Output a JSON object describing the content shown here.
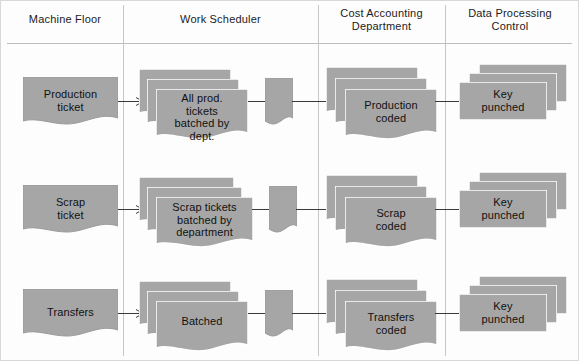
{
  "diagram": {
    "fill_color": "#a6a6a6",
    "edge_color": "#8f8f8f",
    "line_color": "#3a3a3a",
    "divider_color": "#c6c6c6",
    "lanes": [
      {
        "id": "machine-floor",
        "label": "Machine Floor"
      },
      {
        "id": "work-scheduler",
        "label": "Work Scheduler"
      },
      {
        "id": "cost-accounting",
        "label": "Cost Accounting\nDepartment",
        "line1": "Cost Accounting",
        "line2": "Department"
      },
      {
        "id": "data-processing",
        "label": "Data Processing\nControl",
        "line1": "Data Processing",
        "line2": "Control"
      }
    ],
    "rows": [
      {
        "id": "production",
        "source": {
          "label": "Production\nticket",
          "line1": "Production",
          "line2": "ticket",
          "type": "document"
        },
        "batched": {
          "label": "All prod.\ntickets\nbatched by\ndept.",
          "line1": "All prod.",
          "line2": "tickets",
          "line3": "batched by",
          "line4": "dept.",
          "type": "document-stack",
          "copies": 3
        },
        "connector": {
          "label": "",
          "type": "document"
        },
        "coded": {
          "label": "Production\ncoded",
          "line1": "Production",
          "line2": "coded",
          "type": "document-stack",
          "copies": 3
        },
        "punched": {
          "label": "Key\npunched",
          "line1": "Key",
          "line2": "punched",
          "type": "card-stack",
          "copies": 3
        }
      },
      {
        "id": "scrap",
        "source": {
          "label": "Scrap\nticket",
          "line1": "Scrap",
          "line2": "ticket",
          "type": "document"
        },
        "batched": {
          "label": "Scrap tickets\nbatched by\ndepartment",
          "line1": "Scrap tickets",
          "line2": "batched by",
          "line3": "department",
          "type": "document-stack",
          "copies": 3
        },
        "connector": {
          "label": "",
          "type": "document"
        },
        "coded": {
          "label": "Scrap\ncoded",
          "line1": "Scrap",
          "line2": "coded",
          "type": "document-stack",
          "copies": 3
        },
        "punched": {
          "label": "Key\npunched",
          "line1": "Key",
          "line2": "punched",
          "type": "card-stack",
          "copies": 3
        }
      },
      {
        "id": "transfers",
        "source": {
          "label": "Transfers",
          "line1": "Transfers",
          "line2": "",
          "type": "document"
        },
        "batched": {
          "label": "Batched",
          "line1": "Batched",
          "line2": "",
          "line3": "",
          "line4": "",
          "type": "document-stack",
          "copies": 3
        },
        "connector": {
          "label": "",
          "type": "document"
        },
        "coded": {
          "label": "Transfers\ncoded",
          "line1": "Transfers",
          "line2": "coded",
          "type": "document-stack",
          "copies": 3
        },
        "punched": {
          "label": "Key\npunched",
          "line1": "Key",
          "line2": "punched",
          "type": "card-stack",
          "copies": 3
        }
      }
    ]
  }
}
